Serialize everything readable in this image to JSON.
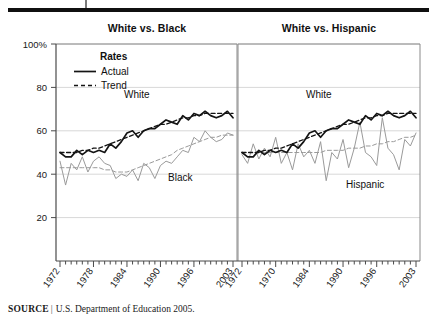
{
  "figure": {
    "panels": [
      {
        "title": "White vs. Black"
      },
      {
        "title": "White vs. Hispanic"
      }
    ],
    "legend": {
      "title": "Rates",
      "items": [
        {
          "label": "Actual",
          "style": "solid"
        },
        {
          "label": "Trend",
          "style": "dashed"
        }
      ]
    },
    "source": {
      "keyword": "SOURCE",
      "separator": "|",
      "text": "U.S. Department of Education 2005."
    }
  },
  "chart_data": {
    "type": "line",
    "title": "",
    "xlabel": "",
    "ylabel": "",
    "ylim": [
      0,
      100
    ],
    "xlim": [
      1972,
      2003
    ],
    "grid": true,
    "legend_position": "upper-left",
    "y_ticks": [
      "100%",
      "80",
      "60",
      "40",
      "20"
    ],
    "y_tick_values": [
      100,
      80,
      60,
      40,
      20
    ],
    "panels": [
      {
        "title": "White vs. Black",
        "x_tick_labels": [
          "1972",
          "1978",
          "1984",
          "1990",
          "1996",
          "2003"
        ],
        "x_tick_values": [
          1972,
          1978,
          1984,
          1990,
          1996,
          2003
        ],
        "x": [
          1972,
          1973,
          1974,
          1975,
          1976,
          1977,
          1978,
          1979,
          1980,
          1981,
          1982,
          1983,
          1984,
          1985,
          1986,
          1987,
          1988,
          1989,
          1990,
          1991,
          1992,
          1993,
          1994,
          1995,
          1996,
          1997,
          1998,
          1999,
          2000,
          2001,
          2002,
          2003
        ],
        "series": [
          {
            "name": "White",
            "kind": "actual",
            "color": "#141414",
            "style": "solid",
            "annotation": "White",
            "values": [
              50,
              48,
              48,
              51,
              49,
              51,
              50,
              51,
              50,
              54,
              52,
              55,
              59,
              60,
              57,
              60,
              61,
              61,
              63,
              65,
              64,
              63,
              67,
              65,
              68,
              67,
              69,
              67,
              66,
              67,
              69,
              66
            ]
          },
          {
            "name": "White",
            "kind": "trend",
            "color": "#141414",
            "style": "dashed",
            "values": [
              50,
              50,
              50,
              50,
              51,
              51,
              52,
              52,
              53,
              54,
              55,
              56,
              57,
              58,
              59,
              60,
              61,
              62,
              63,
              63,
              64,
              65,
              66,
              66,
              67,
              67,
              68,
              68,
              68,
              68,
              68,
              68
            ]
          },
          {
            "name": "Black",
            "kind": "actual",
            "color": "#9a9a9a",
            "style": "solid",
            "annotation": "Black",
            "values": [
              46,
              35,
              45,
              42,
              48,
              41,
              46,
              48,
              45,
              44,
              38,
              40,
              39,
              42,
              37,
              45,
              43,
              38,
              44,
              46,
              45,
              48,
              51,
              50,
              57,
              55,
              60,
              57,
              55,
              56,
              59,
              58
            ]
          },
          {
            "name": "Black",
            "kind": "trend",
            "color": "#9a9a9a",
            "style": "dashed",
            "values": [
              43,
              43,
              43,
              43,
              43,
              43,
              43,
              43,
              42,
              42,
              41,
              41,
              41,
              42,
              43,
              44,
              45,
              46,
              47,
              48,
              49,
              51,
              52,
              53,
              54,
              55,
              56,
              57,
              57,
              58,
              58,
              58
            ]
          }
        ]
      },
      {
        "title": "White vs. Hispanic",
        "x_tick_labels": [
          "1972",
          "1970",
          "1984",
          "1990",
          "1996",
          "2003"
        ],
        "x_tick_values": [
          1972,
          1978,
          1984,
          1990,
          1996,
          2003
        ],
        "x": [
          1972,
          1973,
          1974,
          1975,
          1976,
          1977,
          1978,
          1979,
          1980,
          1981,
          1982,
          1983,
          1984,
          1985,
          1986,
          1987,
          1988,
          1989,
          1990,
          1991,
          1992,
          1993,
          1994,
          1995,
          1996,
          1997,
          1998,
          1999,
          2000,
          2001,
          2002,
          2003
        ],
        "series": [
          {
            "name": "White",
            "kind": "actual",
            "color": "#141414",
            "style": "solid",
            "annotation": "White",
            "values": [
              50,
              48,
              48,
              51,
              49,
              51,
              50,
              51,
              50,
              54,
              52,
              55,
              59,
              60,
              57,
              60,
              61,
              61,
              63,
              65,
              64,
              63,
              67,
              65,
              68,
              67,
              69,
              67,
              66,
              67,
              69,
              66
            ]
          },
          {
            "name": "White",
            "kind": "trend",
            "color": "#141414",
            "style": "dashed",
            "values": [
              50,
              50,
              50,
              50,
              51,
              51,
              52,
              52,
              53,
              54,
              55,
              56,
              57,
              58,
              59,
              60,
              61,
              62,
              63,
              63,
              64,
              65,
              66,
              66,
              67,
              67,
              68,
              68,
              68,
              68,
              68,
              68
            ]
          },
          {
            "name": "Hispanic",
            "kind": "actual",
            "color": "#9a9a9a",
            "style": "solid",
            "annotation": "Hispanic",
            "values": [
              49,
              45,
              54,
              47,
              52,
              48,
              57,
              45,
              50,
              42,
              54,
              48,
              51,
              45,
              55,
              37,
              50,
              47,
              56,
              43,
              52,
              64,
              50,
              48,
              44,
              66,
              52,
              49,
              42,
              56,
              53,
              59
            ]
          },
          {
            "name": "Hispanic",
            "kind": "trend",
            "color": "#9a9a9a",
            "style": "dashed",
            "values": [
              50,
              50,
              50,
              50,
              50,
              50,
              50,
              50,
              50,
              50,
              50,
              50,
              50,
              50,
              50,
              51,
              51,
              51,
              51,
              52,
              52,
              52,
              53,
              53,
              54,
              54,
              55,
              55,
              56,
              57,
              57,
              58
            ]
          }
        ]
      }
    ]
  }
}
